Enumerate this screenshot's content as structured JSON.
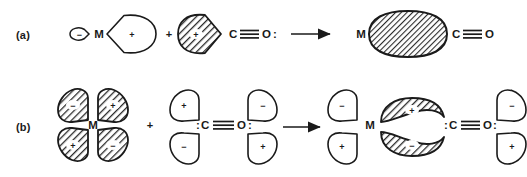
{
  "figure": {
    "type": "chemistry-orbital-diagram",
    "background_color": "#ffffff",
    "ink_color": "#1a1a1a",
    "hatch_color": "#2b2b2b",
    "rows": [
      {
        "id": "a",
        "label": "(a)",
        "description": "sigma donation from CO lone pair into metal sp hybrid orbital",
        "reactant_metal": {
          "atom_label": "M",
          "orbital": "sp-hybrid",
          "lobes": [
            {
              "name": "small-back-lobe",
              "sign": "−",
              "filled": false,
              "direction": "left"
            },
            {
              "name": "large-front-lobe",
              "sign": "+",
              "filled": false,
              "direction": "right"
            }
          ]
        },
        "separator": "+",
        "reactant_ligand": {
          "atom_label": "C",
          "bond": "≡",
          "atom_label2": "O",
          "lone_pair_right": ":",
          "formula": "C≡O:",
          "orbital": "carbon lone pair sp hybrid",
          "lobes": [
            {
              "name": "lone-pair-lobe",
              "sign": "+",
              "filled": true,
              "direction": "right"
            }
          ]
        },
        "arrow": "→",
        "product": {
          "atom_label": "M",
          "bond_orbital": {
            "name": "sigma-bond-orbital",
            "shape": "ellipse",
            "filled": true,
            "sign": ""
          },
          "formula": "C≡O",
          "atom_label2": "C",
          "bond": "≡",
          "atom_label3": "O"
        }
      },
      {
        "id": "b",
        "label": "(b)",
        "description": "pi backbonding from metal d orbital into CO pi-star antibonding orbital",
        "reactant_metal": {
          "atom_label": "M",
          "orbital": "d-orbital",
          "lobes": [
            {
              "name": "lobe-top-left",
              "sign": "−",
              "filled": true
            },
            {
              "name": "lobe-top-right",
              "sign": "+",
              "filled": true
            },
            {
              "name": "lobe-bottom-left",
              "sign": "+",
              "filled": true
            },
            {
              "name": "lobe-bottom-right",
              "sign": "−",
              "filled": true
            }
          ]
        },
        "separator": "+",
        "reactant_ligand": {
          "formula": ":C≡O:",
          "lone_pair_left": ":",
          "atom_label": "C",
          "bond": "≡",
          "atom_label2": "O",
          "lone_pair_right": ":",
          "orbital": "pi-star antibonding",
          "lobes": [
            {
              "name": "pistar-top-left",
              "sign": "+",
              "filled": false
            },
            {
              "name": "pistar-top-right",
              "sign": "−",
              "filled": false
            },
            {
              "name": "pistar-bottom-left",
              "sign": "−",
              "filled": false
            },
            {
              "name": "pistar-bottom-right",
              "sign": "+",
              "filled": false
            }
          ]
        },
        "arrow": "→",
        "product": {
          "atom_label": "M",
          "formula": ":C≡O:",
          "lone_pair_left": ":",
          "atom_label2": "C",
          "bond": "≡",
          "atom_label3": "O",
          "lone_pair_right": ":",
          "lobes": [
            {
              "name": "residual-metal-lobe-top",
              "sign": "−",
              "filled": false
            },
            {
              "name": "residual-metal-lobe-bottom",
              "sign": "+",
              "filled": false
            },
            {
              "name": "backbond-lobe-top",
              "sign": "+",
              "filled": true,
              "shape": "banana"
            },
            {
              "name": "backbond-lobe-bottom",
              "sign": "−",
              "filled": true,
              "shape": "banana"
            },
            {
              "name": "residual-pistar-lobe-top",
              "sign": "−",
              "filled": false
            },
            {
              "name": "residual-pistar-lobe-bottom",
              "sign": "+",
              "filled": false
            }
          ]
        }
      }
    ]
  }
}
